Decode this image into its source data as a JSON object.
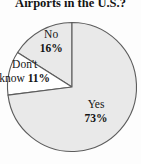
{
  "title": "Airports in the U.S.?",
  "chart_data": {
    "type": "pie",
    "title": "Airports in the U.S.?",
    "slices": [
      {
        "label": "No",
        "percent": 16,
        "display": "16%",
        "display_lines": [
          "No",
          "16%"
        ],
        "fill": "#e9e9e9"
      },
      {
        "label": "Don't know",
        "percent": 11,
        "display": "11%",
        "display_lines": [
          "Don't",
          "know 11%"
        ],
        "fill": "#ffffff"
      },
      {
        "label": "Yes",
        "percent": 73,
        "display": "73%",
        "display_lines": [
          "Yes",
          "73%"
        ],
        "fill": "#e9e9e9"
      }
    ],
    "start_angle_deg": 90,
    "direction": "counterclockwise",
    "legend": "none",
    "colors": {
      "stroke": "#5c5c5c",
      "text": "#141414",
      "background": "#ffffff"
    }
  }
}
